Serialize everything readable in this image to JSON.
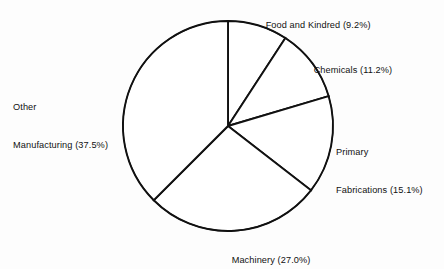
{
  "chart_data": {
    "type": "pie",
    "title": "",
    "subtitle": "",
    "xlabel": "",
    "ylabel": "",
    "grid": false,
    "legend_position": "none",
    "label_format": "name (percent%)",
    "start_angle_deg": 0,
    "direction": "clockwise",
    "center": {
      "x": 228,
      "y": 126
    },
    "radius": 105,
    "categories": [
      "Food and Kindred",
      "Chemicals",
      "Primary Fabrications",
      "Machinery",
      "Other Manufacturing"
    ],
    "values": [
      9.2,
      11.2,
      15.1,
      27.0,
      37.5
    ],
    "slices": [
      {
        "name": "Food and Kindred",
        "value": 9.2,
        "percent_text": "9.2%",
        "label": "Food and Kindred (9.2%)",
        "label_lines": [
          "Food and Kindred (9.2%)"
        ],
        "start_angle_deg": 0.0,
        "end_angle_deg": 33.12
      },
      {
        "name": "Chemicals",
        "value": 11.2,
        "percent_text": "11.2%",
        "label": "Chemicals (11.2%)",
        "label_lines": [
          "Chemicals (11.2%)"
        ],
        "start_angle_deg": 33.12,
        "end_angle_deg": 73.44
      },
      {
        "name": "Primary Fabrications",
        "value": 15.1,
        "percent_text": "15.1%",
        "label": "Primary Fabrications (15.1%)",
        "label_lines": [
          "Primary",
          "Fabrications (15.1%)"
        ],
        "start_angle_deg": 73.44,
        "end_angle_deg": 127.8
      },
      {
        "name": "Machinery",
        "value": 27.0,
        "percent_text": "27.0%",
        "label": "Machinery (27.0%)",
        "label_lines": [
          "Machinery (27.0%)"
        ],
        "start_angle_deg": 127.8,
        "end_angle_deg": 225.0
      },
      {
        "name": "Other Manufacturing",
        "value": 37.5,
        "percent_text": "37.5%",
        "label": "Other Manufacturing (37.5%)",
        "label_lines": [
          "Other",
          "Manufacturing (37.5%)"
        ],
        "start_angle_deg": 225.0,
        "end_angle_deg": 360.0
      }
    ],
    "colors": {
      "slice_fill": "#ffffff",
      "slice_stroke": "#111111",
      "background": "#fdfdfd",
      "text": "#111111"
    }
  },
  "labels": {
    "food": "Food and Kindred (9.2%)",
    "chemicals": "Chemicals (11.2%)",
    "primary_line1": "Primary",
    "primary_line2": "Fabrications (15.1%)",
    "machinery": "Machinery (27.0%)",
    "other_line1": "Other",
    "other_line2": "Manufacturing (37.5%)"
  }
}
